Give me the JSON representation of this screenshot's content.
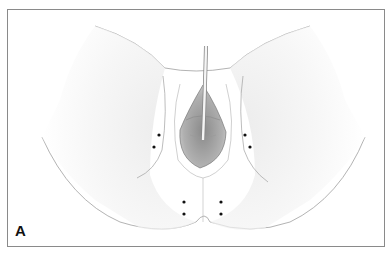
{
  "figure": {
    "panel_label": "A",
    "colors": {
      "frame": "#8a8a8a",
      "contour": "#9a9a9a",
      "shade": "#e6e6e6",
      "marker": "#111111"
    },
    "markers": [
      {
        "x": 159,
        "y": 135
      },
      {
        "x": 154,
        "y": 147
      },
      {
        "x": 245,
        "y": 135
      },
      {
        "x": 250,
        "y": 147
      },
      {
        "x": 184,
        "y": 202
      },
      {
        "x": 184,
        "y": 214
      },
      {
        "x": 221,
        "y": 202
      },
      {
        "x": 221,
        "y": 214
      }
    ]
  }
}
